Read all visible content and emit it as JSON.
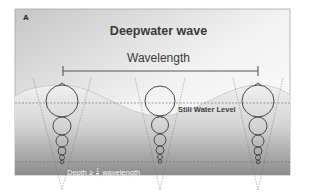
{
  "panel_label": "A",
  "title": "Deepwater wave",
  "wavelength_label": "Wavelength",
  "still_water_label": "Still Water Level",
  "depth_label": {
    "prefix": "Depth ≥",
    "fraction_numerator": "1",
    "fraction_denominator": "2",
    "suffix": "wavelength"
  },
  "colors": {
    "background_top": "#f7f7f7",
    "background_bottom": "#8e8e8e",
    "wave_fill": "#ececec",
    "line": "#4a4a4a",
    "dashed": "#6a6a6a",
    "frame": "#a8a8a8"
  },
  "orbital_columns": [
    {
      "x": 62,
      "circle_radii": [
        16,
        9,
        6,
        4,
        3,
        2
      ]
    },
    {
      "x": 160,
      "circle_radii": [
        16,
        9,
        6,
        4,
        3,
        2
      ]
    },
    {
      "x": 258,
      "circle_radii": [
        16,
        9,
        6,
        4,
        3,
        2
      ]
    }
  ]
}
